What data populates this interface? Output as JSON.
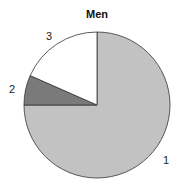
{
  "chart_data": {
    "type": "pie",
    "title": "Men",
    "categories": [
      "1",
      "2",
      "3"
    ],
    "values": [
      75,
      6.6,
      18.4
    ],
    "colors": [
      "#c2c2c2",
      "#7a7a7a",
      "#ffffff"
    ],
    "start_angle": "12 o'clock",
    "direction": "clockwise",
    "legend": "none (slice labels outside)"
  },
  "labels": {
    "s1": "1",
    "s2": "2",
    "s3": "3"
  }
}
